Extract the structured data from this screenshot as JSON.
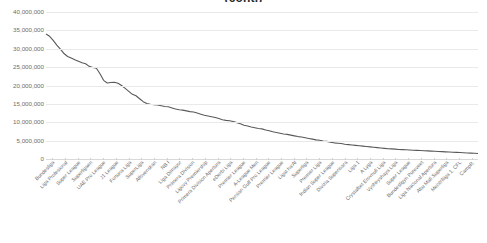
{
  "chart_data": {
    "type": "line",
    "title": "(cont.)",
    "xlabel": "",
    "ylabel": "",
    "ylim": [
      0,
      40000000
    ],
    "ytick_labels": [
      "40,000,000",
      "35,000,000",
      "30,000,000",
      "25,000,000",
      "20,000,000",
      "15,000,000",
      "10,000,000",
      "5,000,000",
      "0"
    ],
    "ytick_values": [
      40000000,
      35000000,
      30000000,
      25000000,
      20000000,
      15000000,
      10000000,
      5000000,
      0
    ],
    "grid": true,
    "legend": "none",
    "line_color": "#595959",
    "categories": [
      "Bundesliga",
      "Liga Profesional",
      "Super League",
      "Superligaen",
      "UAE Pro League",
      "J1 League",
      "Fortuna Liga",
      "SuperLiga",
      "Allsvenskan",
      "NB I",
      "Liga Dimayor",
      "Primera Division",
      "Ligovy Premiership",
      "Primera Division Apertura",
      "eDerbi Liga",
      "Premier League",
      "A-League Men",
      "Persian Gulf Pro League",
      "Premier League",
      "Ligat ha'Al",
      "Superliga",
      "Premier Liga",
      "Indian Super League",
      "Divizia Superioara",
      "Liga 1",
      "A Lyga",
      "Crystalbet Erovnuli Liga",
      "Vysheyshaya Liga",
      "Super League",
      "Bundesligyn Pureveet",
      "Liga Nacional Apertura",
      "Abu Mali Superliga",
      "Meistriliiga 1. CFL",
      "CampR."
    ],
    "values": [
      34000000,
      31000000,
      27800000,
      26400000,
      25200000,
      24700000,
      20700000,
      20900000,
      19200000,
      17200000,
      15100000,
      14700000,
      14200000,
      13300000,
      12800000,
      11700000,
      11000000,
      10400000,
      9600000,
      9000000,
      8200000,
      7400000,
      6700000,
      6000000,
      5400000,
      4900000,
      4400000,
      4000000,
      3600000,
      3200000,
      2800000,
      2400000,
      2000000,
      1500000
    ],
    "dense_points": [
      34000000,
      33400000,
      32300000,
      31000000,
      29900000,
      28700000,
      27900000,
      27500000,
      27000000,
      26600000,
      26200000,
      25900000,
      25200000,
      24900000,
      24700000,
      23200000,
      21400000,
      20700000,
      20800000,
      20900000,
      20600000,
      20000000,
      19200000,
      18400000,
      17600000,
      17200000,
      16400000,
      15600000,
      15100000,
      14900000,
      14800000,
      14700000,
      14500000,
      14300000,
      14200000,
      13900000,
      13600000,
      13400000,
      13300000,
      13100000,
      12900000,
      12800000,
      12500000,
      12200000,
      11900000,
      11700000,
      11500000,
      11300000,
      11000000,
      10700000,
      10500000,
      10400000,
      10200000,
      9900000,
      9600000,
      9200000,
      9000000,
      8700000,
      8500000,
      8300000,
      8200000,
      7900000,
      7700000,
      7400000,
      7200000,
      7000000,
      6800000,
      6700000,
      6500000,
      6300000,
      6100000,
      6000000,
      5800000,
      5600000,
      5400000,
      5200000,
      5100000,
      4900000,
      4800000,
      4600000,
      4400000,
      4300000,
      4200000,
      4000000,
      3900000,
      3800000,
      3700000,
      3600000,
      3500000,
      3400000,
      3300000,
      3200000,
      3100000,
      3000000,
      2900000,
      2800000,
      2750000,
      2700000,
      2600000,
      2550000,
      2500000,
      2450000,
      2400000,
      2350000,
      2300000,
      2250000,
      2200000,
      2150000,
      2100000,
      2050000,
      2000000,
      1950000,
      1900000,
      1850000,
      1800000,
      1750000,
      1700000,
      1650000,
      1600000,
      1550000,
      1500000
    ]
  }
}
